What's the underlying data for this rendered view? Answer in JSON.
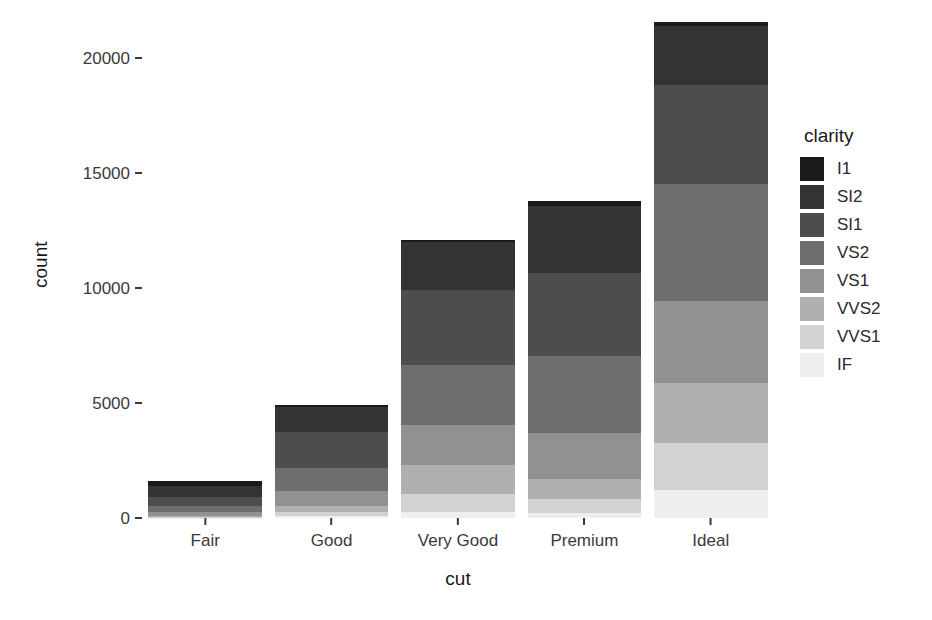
{
  "chart_data": {
    "type": "bar",
    "stacked": true,
    "title": "",
    "xlabel": "cut",
    "ylabel": "count",
    "categories": [
      "Fair",
      "Good",
      "Very Good",
      "Premium",
      "Ideal"
    ],
    "legend_title": "clarity",
    "legend_position": "right",
    "grid": false,
    "ylim": [
      0,
      21600
    ],
    "yticks": [
      0,
      5000,
      10000,
      15000,
      20000
    ],
    "ytick_labels": [
      "0",
      "5000",
      "10000",
      "15000",
      "20000"
    ],
    "series": [
      {
        "name": "I1",
        "color": "#1a1a1a",
        "values": [
          210,
          96,
          84,
          205,
          146
        ]
      },
      {
        "name": "SI2",
        "color": "#333333",
        "values": [
          466,
          1081,
          2100,
          2949,
          2598
        ]
      },
      {
        "name": "SI1",
        "color": "#4d4d4d",
        "values": [
          408,
          1560,
          3240,
          3575,
          4282
        ]
      },
      {
        "name": "VS2",
        "color": "#6e6e6e",
        "values": [
          261,
          978,
          2591,
          3357,
          5071
        ]
      },
      {
        "name": "VS1",
        "color": "#919191",
        "values": [
          170,
          648,
          1775,
          1989,
          3589
        ]
      },
      {
        "name": "VVS2",
        "color": "#b0b0b0",
        "values": [
          69,
          286,
          1235,
          870,
          2606
        ]
      },
      {
        "name": "VVS1",
        "color": "#d2d2d2",
        "values": [
          17,
          186,
          789,
          616,
          2047
        ]
      },
      {
        "name": "IF",
        "color": "#efefef",
        "values": [
          9,
          71,
          268,
          230,
          1212
        ]
      }
    ],
    "totals": [
      1610,
      4906,
      12082,
      13791,
      21551
    ]
  },
  "axis": {
    "y_title": "count",
    "x_title": "cut"
  },
  "legend": {
    "title": "clarity"
  }
}
